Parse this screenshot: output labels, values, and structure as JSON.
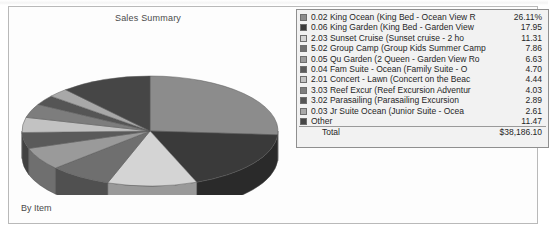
{
  "chart_panel": {
    "title": "Sales Summary",
    "footer": "By Item"
  },
  "legend": {
    "total_label": "Total",
    "total_value": "$38,186.10"
  },
  "chart_data": {
    "type": "pie",
    "title": "Sales Summary",
    "subtitle": "By Item",
    "legend_position": "right",
    "unit": "percent",
    "total_label": "Total",
    "total_value": "$38,186.10",
    "categories": [
      "0.02 King Ocean (King Bed - Ocean View R",
      "0.06 King Garden (King Bed - Garden View",
      "2.03 Sunset Cruise (Sunset cruise - 2 ho",
      "5.02 Group Camp (Group Kids Summer Camp",
      "0.05 Qu Garden (2 Queen - Garden View Ro",
      "0.04 Fam Suite - Ocean (Family Suite - O",
      "2.01 Concert - Lawn (Concert on the Beac",
      "3.03 Reef Excur (Reef Excursion Adventur",
      "3.02 Parasailing (Parasailing Excursion",
      "0.03 Jr Suite Ocean (Junior Suite - Ocea",
      "Other"
    ],
    "values": [
      26.11,
      17.95,
      11.31,
      7.86,
      6.63,
      4.7,
      4.44,
      4.03,
      2.89,
      2.61,
      11.47
    ],
    "value_labels": [
      "26.11%",
      "17.95",
      "11.31",
      "7.86",
      "6.63",
      "4.70",
      "4.44",
      "4.03",
      "2.89",
      "2.61",
      "11.47"
    ],
    "colors": [
      "#8c8c8c",
      "#3a3a3a",
      "#d4d4d4",
      "#6f6f6f",
      "#9a9a9a",
      "#5a5a5a",
      "#c2c2c2",
      "#7d7d7d",
      "#555555",
      "#a8a8a8",
      "#464646"
    ]
  }
}
